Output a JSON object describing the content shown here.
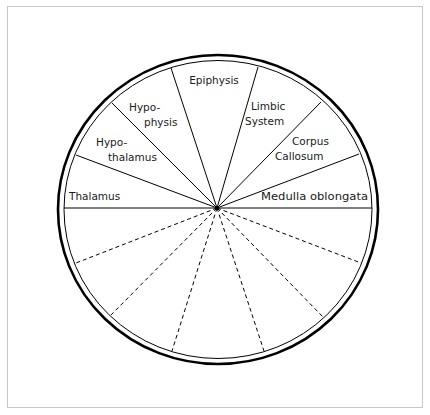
{
  "diagram": {
    "type": "circle-divided-into-sectors",
    "labeled_sectors": [
      {
        "id": "thalamus",
        "lines": [
          "Thalamus"
        ]
      },
      {
        "id": "hypothalamus",
        "lines": [
          "Hypo-",
          "thalamus"
        ]
      },
      {
        "id": "hypophysis",
        "lines": [
          "Hypo-",
          "physis"
        ]
      },
      {
        "id": "epiphysis",
        "lines": [
          "Epiphysis"
        ]
      },
      {
        "id": "limbic-system",
        "lines": [
          "Limbic",
          "System"
        ]
      },
      {
        "id": "corpus-callosum",
        "lines": [
          "Corpus",
          "Callosum"
        ]
      },
      {
        "id": "medulla-oblongata",
        "lines": [
          "Medulla oblongata"
        ]
      }
    ],
    "unlabeled_sectors_count": 7,
    "upper_dividers_style": "solid",
    "lower_dividers_style": "dashed",
    "colors": {
      "stroke": "#000000",
      "text": "#1a1a1a",
      "frame": "#c8c8c8",
      "background": "#ffffff"
    }
  }
}
